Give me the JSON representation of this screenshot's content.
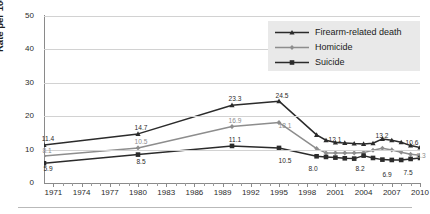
{
  "chart_data": {
    "type": "line",
    "title": "",
    "xlabel": "",
    "ylabel": "Rate per 100,000",
    "xlim": [
      1970,
      2010
    ],
    "ylim": [
      0,
      50
    ],
    "yticks": [
      0,
      10,
      20,
      30,
      40,
      50
    ],
    "xticks": [
      1971,
      1974,
      1977,
      1980,
      1983,
      1986,
      1989,
      1992,
      1995,
      1998,
      2001,
      2004,
      2007,
      2010
    ],
    "xtick_labels": [
      "1971",
      "1974",
      "1977",
      "1980",
      "1983",
      "1986",
      "1989",
      "1992",
      "1995",
      "1998",
      "2001",
      "2004",
      "2007",
      "2010"
    ],
    "ytick_labels": [
      "0",
      "10",
      "20",
      "30",
      "40",
      "50"
    ],
    "grid": "horizontal",
    "legend_position": "top-right",
    "series": [
      {
        "name": "Firearm-related death",
        "color": "#2b2b2b",
        "marker": "triangle",
        "x": [
          1970,
          1980,
          1990,
          1995,
          1999,
          2000,
          2001,
          2002,
          2003,
          2004,
          2005,
          2006,
          2007,
          2008,
          2009,
          2010
        ],
        "values": [
          11.4,
          14.7,
          23.3,
          24.5,
          14.4,
          12.8,
          12.1,
          12.0,
          11.8,
          11.7,
          11.9,
          13.2,
          12.8,
          12.2,
          11.2,
          10.6
        ]
      },
      {
        "name": "Homicide",
        "color": "#8d8d8d",
        "marker": "diamond",
        "x": [
          1970,
          1980,
          1990,
          1995,
          1999,
          2000,
          2001,
          2002,
          2003,
          2004,
          2005,
          2006,
          2007,
          2008,
          2009,
          2010
        ],
        "values": [
          8.1,
          10.5,
          16.9,
          18.1,
          10.3,
          9.0,
          9.0,
          9.0,
          9.0,
          9.1,
          9.8,
          10.4,
          9.9,
          9.2,
          8.6,
          8.3
        ]
      },
      {
        "name": "Suicide",
        "color": "#2b2b2b",
        "marker": "square",
        "x": [
          1970,
          1980,
          1990,
          1995,
          1999,
          2000,
          2001,
          2002,
          2003,
          2004,
          2005,
          2006,
          2007,
          2008,
          2009,
          2010
        ],
        "values": [
          5.9,
          8.5,
          11.1,
          10.5,
          8.0,
          7.8,
          7.6,
          7.4,
          7.3,
          8.2,
          7.5,
          7.0,
          6.9,
          6.9,
          7.2,
          7.5
        ]
      }
    ],
    "point_labels": [
      {
        "series": "Firearm-related death",
        "x": 1970,
        "value": 11.4,
        "text": "11.4",
        "tone": "dark",
        "px": 48,
        "py": 136
      },
      {
        "series": "Firearm-related death",
        "x": 1980,
        "value": 14.7,
        "text": "14.7",
        "tone": "dark",
        "px": 141,
        "py": 125
      },
      {
        "series": "Firearm-related death",
        "x": 1990,
        "value": 23.3,
        "text": "23.3",
        "tone": "dark",
        "px": 235,
        "py": 96
      },
      {
        "series": "Firearm-related death",
        "x": 1995,
        "value": 24.5,
        "text": "24.5",
        "tone": "dark",
        "px": 282,
        "py": 93
      },
      {
        "series": "Firearm-related death",
        "x": 2001,
        "value": 12.1,
        "text": "12.1",
        "tone": "dark",
        "px": 335,
        "py": 137
      },
      {
        "series": "Firearm-related death",
        "x": 2006,
        "value": 13.2,
        "text": "13.2",
        "tone": "dark",
        "px": 382,
        "py": 133
      },
      {
        "series": "Firearm-related death",
        "x": 2010,
        "value": 10.6,
        "text": "10.6",
        "tone": "dark",
        "px": 412,
        "py": 140
      },
      {
        "series": "Homicide",
        "x": 1970,
        "value": 8.1,
        "text": "8.1",
        "tone": "gray",
        "px": 47,
        "py": 148
      },
      {
        "series": "Homicide",
        "x": 1980,
        "value": 10.5,
        "text": "10.5",
        "tone": "gray",
        "px": 141,
        "py": 139
      },
      {
        "series": "Homicide",
        "x": 1990,
        "value": 16.9,
        "text": "16.9",
        "tone": "gray",
        "px": 235,
        "py": 118
      },
      {
        "series": "Homicide",
        "x": 1995,
        "value": 18.1,
        "text": "18.1",
        "tone": "gray",
        "px": 285,
        "py": 123
      },
      {
        "series": "Homicide",
        "x": 2010,
        "value": 8.3,
        "text": "8.3",
        "tone": "gray",
        "px": 421,
        "py": 153
      },
      {
        "series": "Suicide",
        "x": 1970,
        "value": 5.9,
        "text": "5.9",
        "tone": "dark",
        "px": 48,
        "py": 166
      },
      {
        "series": "Suicide",
        "x": 1980,
        "value": 8.5,
        "text": "8.5",
        "tone": "dark",
        "px": 141,
        "py": 159
      },
      {
        "series": "Suicide",
        "x": 1990,
        "value": 11.1,
        "text": "11.1",
        "tone": "dark",
        "px": 235,
        "py": 137
      },
      {
        "series": "Suicide",
        "x": 1995,
        "value": 10.5,
        "text": "10.5",
        "tone": "dark",
        "px": 285,
        "py": 158
      },
      {
        "series": "Suicide",
        "x": 1999,
        "value": 8.0,
        "text": "8.0",
        "tone": "dark",
        "px": 313,
        "py": 166
      },
      {
        "series": "Suicide",
        "x": 2004,
        "value": 8.2,
        "text": "8.2",
        "tone": "dark",
        "px": 360,
        "py": 166
      },
      {
        "series": "Suicide",
        "x": 2007,
        "value": 6.9,
        "text": "6.9",
        "tone": "dark",
        "px": 387,
        "py": 172
      },
      {
        "series": "Suicide",
        "x": 2010,
        "value": 7.5,
        "text": "7.5",
        "tone": "dark",
        "px": 408,
        "py": 170
      }
    ]
  },
  "legend": {
    "items": [
      {
        "label": "Firearm-related death",
        "marker": "triangle",
        "color": "#2b2b2b"
      },
      {
        "label": "Homicide",
        "marker": "diamond",
        "color": "#8d8d8d"
      },
      {
        "label": "Suicide",
        "marker": "square",
        "color": "#2b2b2b"
      }
    ]
  },
  "colors": {
    "firearm": "#2b2b2b",
    "homicide": "#8d8d8d",
    "suicide": "#2b2b2b",
    "grid": "#d2d2d2",
    "axis": "#8a8a8a",
    "legend_bg": "#e9e9e9"
  }
}
